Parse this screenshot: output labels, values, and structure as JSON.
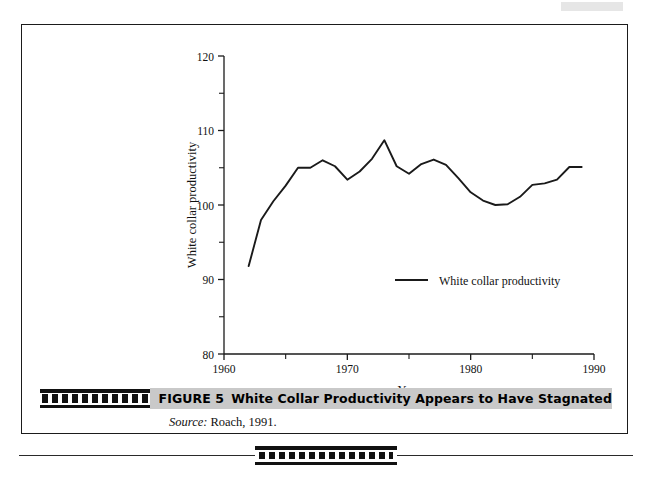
{
  "figure": {
    "label": "FIGURE 5",
    "title": "White Collar Productivity Appears to Have Stagnated",
    "caption_bar_color": "#c9c9c9",
    "source_label": "Source:",
    "source_text": "Roach, 1991."
  },
  "chart_data": {
    "type": "line",
    "title": "",
    "xlabel": "Year",
    "ylabel": "White collar productivity",
    "xlim": [
      1960,
      1990
    ],
    "ylim": [
      80,
      120
    ],
    "xticks": [
      1960,
      1965,
      1970,
      1975,
      1980,
      1985,
      1990
    ],
    "xticklabels": [
      "1960",
      "",
      "1970",
      "",
      "1980",
      "",
      "1990"
    ],
    "xtick_major_labels": [
      "1960",
      "1970",
      "1980",
      "1990"
    ],
    "yticks": [
      80,
      85,
      90,
      95,
      100,
      105,
      110,
      115,
      120
    ],
    "yticklabels": [
      "80",
      "",
      "90",
      "",
      "100",
      "",
      "110",
      "",
      "120"
    ],
    "ytick_major_labels": [
      "80",
      "90",
      "100",
      "110",
      "120"
    ],
    "grid": false,
    "legend_position": "center-right-inside",
    "series": [
      {
        "name": "White collar productivity",
        "color": "#1a1a1a",
        "x": [
          1962,
          1963,
          1964,
          1965,
          1966,
          1967,
          1968,
          1969,
          1970,
          1971,
          1972,
          1973,
          1974,
          1975,
          1976,
          1977,
          1978,
          1979,
          1980,
          1981,
          1982,
          1983,
          1984,
          1985,
          1986,
          1987,
          1988,
          1989
        ],
        "values": [
          91.8,
          98.0,
          100.5,
          102.6,
          105.0,
          105.0,
          106.0,
          105.2,
          103.4,
          104.5,
          106.2,
          108.7,
          105.2,
          104.2,
          105.5,
          106.1,
          105.4,
          103.6,
          101.7,
          100.6,
          100.0,
          100.1,
          101.1,
          102.7,
          102.9,
          103.4,
          105.1,
          105.1
        ]
      }
    ],
    "legend": [
      {
        "label": "White collar productivity",
        "color": "#1a1a1a"
      }
    ]
  }
}
